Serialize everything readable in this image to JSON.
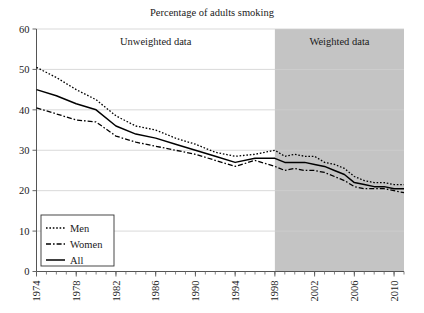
{
  "chart_data": {
    "type": "line",
    "title": "Percentage of adults smoking",
    "xlabel": "",
    "ylabel": "",
    "xlim": [
      1974,
      2011
    ],
    "ylim": [
      0,
      60
    ],
    "yticks": [
      0,
      10,
      20,
      30,
      40,
      50,
      60
    ],
    "xticks": [
      1974,
      1978,
      1982,
      1986,
      1990,
      1994,
      1998,
      2002,
      2006,
      2010
    ],
    "xtick_labels": [
      "1974",
      "1978",
      "1982",
      "1986",
      "1990",
      "1994",
      "1998",
      "2002",
      "2006",
      "2010"
    ],
    "ytick_labels": [
      "0",
      "10",
      "20",
      "30",
      "40",
      "50",
      "60"
    ],
    "grid": true,
    "grid_axis": "y",
    "legend_position": "bottom-left",
    "x": [
      1974,
      1976,
      1978,
      1980,
      1982,
      1984,
      1986,
      1988,
      1990,
      1992,
      1994,
      1996,
      1998,
      1999,
      2000,
      2001,
      2002,
      2003,
      2004,
      2005,
      2006,
      2007,
      2008,
      2009,
      2010,
      2011
    ],
    "series": [
      {
        "name": "Men",
        "style": "dotted",
        "values": [
          50.5,
          48.0,
          45.0,
          42.5,
          38.5,
          36.0,
          35.0,
          33.0,
          31.5,
          29.5,
          28.5,
          29.0,
          30.0,
          28.5,
          29.0,
          28.5,
          28.5,
          27.0,
          26.5,
          25.5,
          23.5,
          22.5,
          22.0,
          22.0,
          21.5,
          21.5
        ]
      },
      {
        "name": "Women",
        "style": "dash-dot",
        "values": [
          40.5,
          39.0,
          37.5,
          37.0,
          33.5,
          32.0,
          31.0,
          30.0,
          29.0,
          27.5,
          26.0,
          27.5,
          26.0,
          25.0,
          25.5,
          25.0,
          25.0,
          24.5,
          23.5,
          22.5,
          21.0,
          20.5,
          20.5,
          20.5,
          20.0,
          19.5
        ]
      },
      {
        "name": "All",
        "style": "solid",
        "values": [
          45.0,
          43.5,
          41.5,
          40.0,
          36.0,
          34.0,
          33.0,
          31.5,
          30.0,
          28.5,
          27.0,
          28.0,
          28.0,
          27.0,
          27.0,
          27.0,
          26.5,
          26.0,
          25.0,
          24.0,
          22.0,
          21.5,
          21.0,
          21.0,
          20.5,
          20.5
        ]
      }
    ],
    "annotations": [
      {
        "text": "Unweighted data",
        "x_range": [
          1974,
          1998
        ]
      },
      {
        "text": "Weighted data",
        "x_range": [
          1998,
          2011
        ]
      }
    ]
  },
  "regions": {
    "unweighted_label": "Unweighted data",
    "weighted_label": "Weighted data",
    "weighted_fill": "#c4c4c4",
    "unweighted_fill": "#ffffff"
  },
  "legend": {
    "items": [
      {
        "label": "Men",
        "style": "dotted"
      },
      {
        "label": "Women",
        "style": "dash-dot"
      },
      {
        "label": "All",
        "style": "solid"
      }
    ]
  },
  "colors": {
    "line": "#000000",
    "axis": "#555555",
    "grid": "#cfcfcf",
    "text": "#1a1a1a"
  }
}
